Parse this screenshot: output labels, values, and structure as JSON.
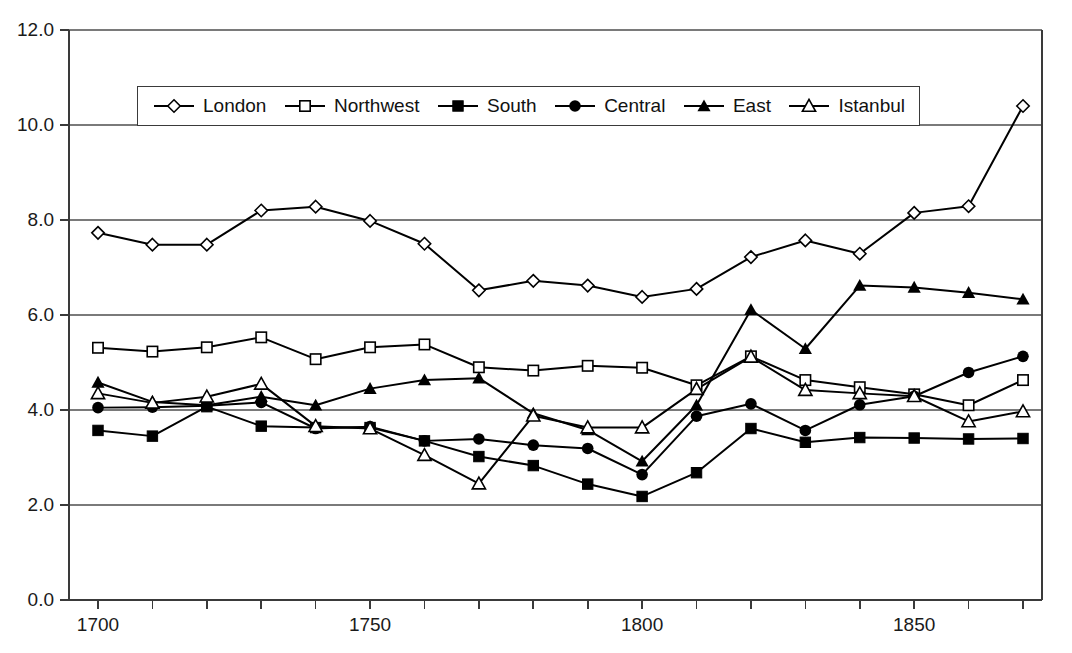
{
  "chart_data": {
    "type": "line",
    "title": "",
    "subtitle": "",
    "xlabel": "",
    "ylabel": "",
    "xlim": [
      1695,
      1875
    ],
    "ylim": [
      0.0,
      12.0
    ],
    "ytick_labels": [
      "0.0",
      "2.0",
      "4.0",
      "6.0",
      "8.0",
      "10.0",
      "12.0"
    ],
    "ytick_values": [
      0.0,
      2.0,
      4.0,
      6.0,
      8.0,
      10.0,
      12.0
    ],
    "xtick_labels": [
      "1700",
      "1750",
      "1800",
      "1850"
    ],
    "xtick_values": [
      1700,
      1750,
      1800,
      1850
    ],
    "xtick_minor_values": [
      1700,
      1710,
      1720,
      1730,
      1740,
      1750,
      1760,
      1770,
      1780,
      1790,
      1800,
      1810,
      1820,
      1830,
      1840,
      1850,
      1860,
      1870
    ],
    "grid": "horizontal",
    "legend_position": "top-center-inside",
    "x": [
      1700,
      1710,
      1720,
      1730,
      1740,
      1750,
      1760,
      1770,
      1780,
      1790,
      1800,
      1810,
      1820,
      1830,
      1840,
      1850,
      1860,
      1870
    ],
    "series": [
      {
        "name": "London",
        "marker": "open-diamond",
        "color": "#000000",
        "values": [
          7.73,
          7.48,
          7.48,
          8.2,
          8.28,
          7.98,
          7.5,
          6.52,
          6.72,
          6.62,
          6.38,
          6.55,
          7.22,
          7.57,
          7.29,
          8.15,
          8.29,
          10.4
        ]
      },
      {
        "name": "Northwest",
        "marker": "open-square",
        "color": "#000000",
        "values": [
          5.31,
          5.23,
          5.32,
          5.53,
          5.07,
          5.32,
          5.38,
          4.9,
          4.83,
          4.93,
          4.89,
          4.52,
          5.13,
          4.63,
          4.48,
          4.33,
          4.1,
          4.63
        ]
      },
      {
        "name": "South",
        "marker": "filled-square",
        "color": "#000000",
        "values": [
          3.57,
          3.45,
          4.07,
          3.66,
          3.63,
          3.63,
          3.35,
          3.02,
          2.83,
          2.44,
          2.18,
          2.68,
          3.61,
          3.32,
          3.42,
          3.41,
          3.39,
          3.4
        ]
      },
      {
        "name": "Central",
        "marker": "filled-circle",
        "color": "#000000",
        "values": [
          4.05,
          4.06,
          4.09,
          4.16,
          3.61,
          3.65,
          3.35,
          3.39,
          3.26,
          3.19,
          2.64,
          3.87,
          4.13,
          3.57,
          4.11,
          4.29,
          4.79,
          5.13
        ]
      },
      {
        "name": "East",
        "marker": "filled-triangle",
        "color": "#000000",
        "values": [
          4.58,
          4.17,
          4.1,
          4.28,
          4.1,
          4.45,
          4.63,
          4.67,
          3.93,
          3.58,
          2.92,
          4.1,
          6.11,
          5.29,
          6.62,
          6.58,
          6.47,
          6.33
        ]
      },
      {
        "name": "Istanbul",
        "marker": "open-triangle",
        "color": "#000000",
        "values": [
          4.35,
          4.15,
          4.28,
          4.55,
          3.66,
          3.61,
          3.05,
          2.45,
          3.88,
          3.63,
          3.63,
          4.44,
          5.12,
          4.42,
          4.35,
          4.29,
          3.76,
          3.97
        ]
      }
    ]
  },
  "legend": {
    "items": [
      {
        "label": "London"
      },
      {
        "label": "Northwest"
      },
      {
        "label": "South"
      },
      {
        "label": "Central"
      },
      {
        "label": "East"
      },
      {
        "label": "Istanbul"
      }
    ]
  },
  "axes": {
    "left_spine_color": "#3a3a3a",
    "gridline_color": "#7a7a7a",
    "line_color": "#000000"
  }
}
